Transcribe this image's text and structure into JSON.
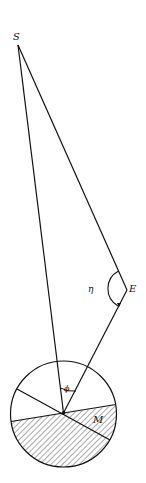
{
  "diagram": {
    "labels": {
      "sun": "S",
      "earth": "E",
      "eta": "η",
      "phi": "ϕ",
      "moon": "M"
    },
    "colors": {
      "stroke": "#111111",
      "background": "#ffffff",
      "hatch": "#555555"
    }
  }
}
